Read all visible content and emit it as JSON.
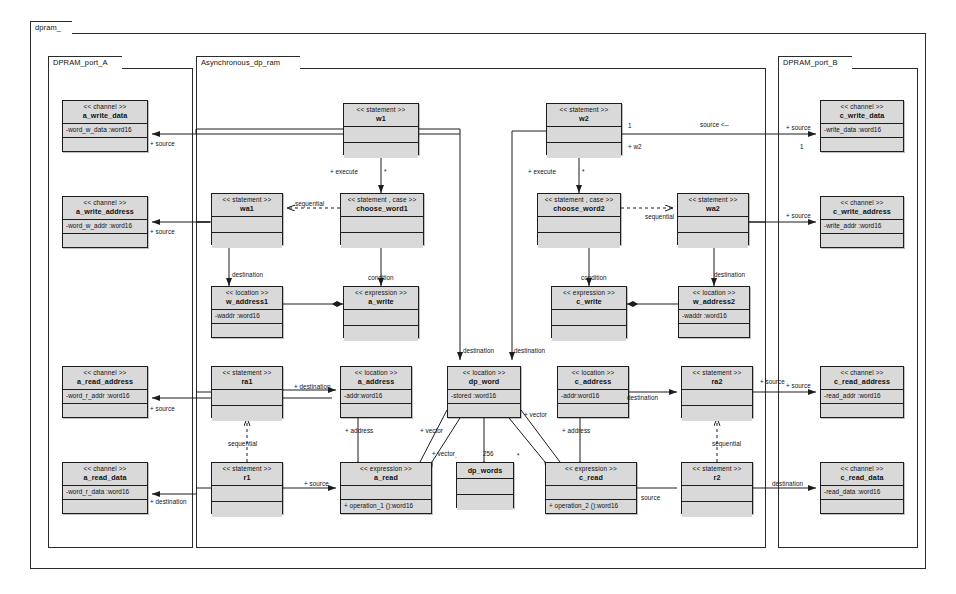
{
  "diagram": {
    "kind": "uml-class-diagram",
    "root_package": "dpram_"
  },
  "packages": [
    {
      "id": "pkg-dpram",
      "label": "dpram_",
      "x": 30,
      "y": 33,
      "w": 896,
      "h": 536,
      "tab_w": 42
    },
    {
      "id": "pkg-port-a",
      "label": "DPRAM_port_A",
      "x": 48,
      "y": 68,
      "w": 145,
      "h": 480,
      "tab_w": 74
    },
    {
      "id": "pkg-async",
      "label": "Asynchronous_dp_ram",
      "x": 196,
      "y": 68,
      "w": 570,
      "h": 480,
      "tab_w": 104
    },
    {
      "id": "pkg-port-b",
      "label": "DPRAM_port_B",
      "x": 778,
      "y": 68,
      "w": 140,
      "h": 480,
      "tab_w": 74
    }
  ],
  "classes": [
    {
      "id": "a_write_data",
      "stereotype": "<< channel >>",
      "name": "a_write_data",
      "attrs": [
        "-word_w_data :word16"
      ],
      "ops": [],
      "x": 62,
      "y": 100,
      "w": 86,
      "h": 52
    },
    {
      "id": "a_write_address",
      "stereotype": "<< channel >>",
      "name": "a_write_address",
      "attrs": [
        "-word_w_addr :word16"
      ],
      "ops": [],
      "x": 62,
      "y": 196,
      "w": 86,
      "h": 52
    },
    {
      "id": "a_read_address",
      "stereotype": "<< channel >>",
      "name": "a_read_address",
      "attrs": [
        "-word_r_addr :word16"
      ],
      "ops": [],
      "x": 62,
      "y": 366,
      "w": 86,
      "h": 52
    },
    {
      "id": "a_read_data",
      "stereotype": "<< channel >>",
      "name": "a_read_data",
      "attrs": [
        "-word_r_data :word16"
      ],
      "ops": [],
      "x": 62,
      "y": 462,
      "w": 86,
      "h": 52
    },
    {
      "id": "c_write_data",
      "stereotype": "<< channel >>",
      "name": "c_write_data",
      "attrs": [
        "-write_data :word16"
      ],
      "ops": [],
      "x": 820,
      "y": 100,
      "w": 84,
      "h": 52
    },
    {
      "id": "c_write_address",
      "stereotype": "<< channel >>",
      "name": "c_write_address",
      "attrs": [
        "-write_addr :word16"
      ],
      "ops": [],
      "x": 820,
      "y": 196,
      "w": 84,
      "h": 52
    },
    {
      "id": "c_read_address",
      "stereotype": "<< channel >>",
      "name": "c_read_address",
      "attrs": [
        "-read_addr :word16"
      ],
      "ops": [],
      "x": 820,
      "y": 366,
      "w": 84,
      "h": 52
    },
    {
      "id": "c_read_data",
      "stereotype": "<< channel >>",
      "name": "c_read_data",
      "attrs": [
        "-read_data :word16"
      ],
      "ops": [],
      "x": 820,
      "y": 462,
      "w": 84,
      "h": 52
    },
    {
      "id": "w1",
      "stereotype": "<< statement >>",
      "name": "w1",
      "attrs": [],
      "ops": [],
      "x": 343,
      "y": 103,
      "w": 76,
      "h": 52
    },
    {
      "id": "w2",
      "stereotype": "<< statement >>",
      "name": "w2",
      "attrs": [],
      "ops": [],
      "x": 546,
      "y": 103,
      "w": 76,
      "h": 52
    },
    {
      "id": "wa1",
      "stereotype": "<< statement >>",
      "name": "wa1",
      "attrs": [],
      "ops": [],
      "x": 211,
      "y": 193,
      "w": 72,
      "h": 52
    },
    {
      "id": "choose_word1",
      "stereotype": "<< statement , case >>",
      "name": "choose_word1",
      "attrs": [],
      "ops": [],
      "x": 340,
      "y": 193,
      "w": 84,
      "h": 52
    },
    {
      "id": "choose_word2",
      "stereotype": "<< statement , case >>",
      "name": "choose_word2",
      "attrs": [],
      "ops": [],
      "x": 537,
      "y": 193,
      "w": 84,
      "h": 52
    },
    {
      "id": "wa2",
      "stereotype": "<< statement >>",
      "name": "wa2",
      "attrs": [],
      "ops": [],
      "x": 677,
      "y": 193,
      "w": 72,
      "h": 52
    },
    {
      "id": "w_address1",
      "stereotype": "<< location >>",
      "name": "w_address1",
      "attrs": [
        "-waddr :word16"
      ],
      "ops": [],
      "x": 211,
      "y": 286,
      "w": 72,
      "h": 52
    },
    {
      "id": "a_write_expr",
      "stereotype": "<< expression >>",
      "name": "a_write",
      "attrs": [],
      "ops": [],
      "x": 343,
      "y": 286,
      "w": 76,
      "h": 52
    },
    {
      "id": "c_write_expr",
      "stereotype": "<< expression >>",
      "name": "c_write",
      "attrs": [],
      "ops": [],
      "x": 551,
      "y": 286,
      "w": 76,
      "h": 52
    },
    {
      "id": "w_address2",
      "stereotype": "<< location >>",
      "name": "w_address2",
      "attrs": [
        "-waddr :word16"
      ],
      "ops": [],
      "x": 678,
      "y": 286,
      "w": 72,
      "h": 52
    },
    {
      "id": "ra1",
      "stereotype": "<< statement >>",
      "name": "ra1",
      "attrs": [],
      "ops": [],
      "x": 211,
      "y": 366,
      "w": 72,
      "h": 52
    },
    {
      "id": "a_address",
      "stereotype": "<< location >>",
      "name": "a_address",
      "attrs": [
        "-addr:word16"
      ],
      "ops": [],
      "x": 340,
      "y": 366,
      "w": 72,
      "h": 52
    },
    {
      "id": "dp_word",
      "stereotype": "<< location >>",
      "name": "dp_word",
      "attrs": [
        "-stored :word16"
      ],
      "ops": [],
      "x": 447,
      "y": 366,
      "w": 74,
      "h": 52
    },
    {
      "id": "c_address",
      "stereotype": "<< location >>",
      "name": "c_address",
      "attrs": [
        "-addr:word16"
      ],
      "ops": [],
      "x": 557,
      "y": 366,
      "w": 72,
      "h": 52
    },
    {
      "id": "ra2",
      "stereotype": "<< statement >>",
      "name": "ra2",
      "attrs": [],
      "ops": [],
      "x": 681,
      "y": 366,
      "w": 72,
      "h": 52
    },
    {
      "id": "r1",
      "stereotype": "<< statement >>",
      "name": "r1",
      "attrs": [],
      "ops": [],
      "x": 211,
      "y": 462,
      "w": 72,
      "h": 52
    },
    {
      "id": "a_read_expr",
      "stereotype": "<< expression >>",
      "name": "a_read",
      "attrs": [],
      "ops": [
        "+ operation_1 ():word16"
      ],
      "x": 340,
      "y": 462,
      "w": 92,
      "h": 52
    },
    {
      "id": "dp_words",
      "stereotype": "",
      "name": "dp_words",
      "attrs": [],
      "ops": [],
      "x": 456,
      "y": 462,
      "w": 58,
      "h": 46
    },
    {
      "id": "c_read_expr",
      "stereotype": "<< expression >>",
      "name": "c_read",
      "attrs": [],
      "ops": [
        "+ operation_2 ():word16"
      ],
      "x": 545,
      "y": 462,
      "w": 92,
      "h": 52
    },
    {
      "id": "r2",
      "stereotype": "<< statement >>",
      "name": "r2",
      "attrs": [],
      "ops": [],
      "x": 681,
      "y": 462,
      "w": 72,
      "h": 52
    }
  ],
  "edge_labels": [
    {
      "id": "l-src-awd",
      "text": "+ source",
      "x": 150,
      "y": 140
    },
    {
      "id": "l-src-awa",
      "text": "+ source",
      "x": 150,
      "y": 228
    },
    {
      "id": "l-src-ara",
      "text": "+ source",
      "x": 150,
      "y": 405
    },
    {
      "id": "l-dst-ard",
      "text": "+ destination",
      "x": 150,
      "y": 498
    },
    {
      "id": "l-src-cwd",
      "text": "+ source",
      "x": 786,
      "y": 124
    },
    {
      "id": "l-one-cwd",
      "text": "1",
      "x": 800,
      "y": 143
    },
    {
      "id": "l-src-cwa",
      "text": "+ source",
      "x": 786,
      "y": 212
    },
    {
      "id": "l-src-cra",
      "text": "+ source",
      "x": 786,
      "y": 382
    },
    {
      "id": "l-dst-crd",
      "text": "destination",
      "x": 772,
      "y": 480
    },
    {
      "id": "l-exec-1",
      "text": "+ execute",
      "x": 330,
      "y": 168
    },
    {
      "id": "l-star-1",
      "text": "*",
      "x": 384,
      "y": 168
    },
    {
      "id": "l-exec-2",
      "text": "+ execute",
      "x": 528,
      "y": 168
    },
    {
      "id": "l-star-2",
      "text": "*",
      "x": 582,
      "y": 168
    },
    {
      "id": "l-one-w2",
      "text": "1",
      "x": 628,
      "y": 122
    },
    {
      "id": "l-plus-w2",
      "text": "+ w2",
      "x": 628,
      "y": 143
    },
    {
      "id": "l-source-arrow",
      "text": "source <--",
      "x": 700,
      "y": 121
    },
    {
      "id": "l-seq-1",
      "text": "sequential",
      "x": 295,
      "y": 200
    },
    {
      "id": "l-seq-2",
      "text": "sequential",
      "x": 645,
      "y": 213
    },
    {
      "id": "l-dest-wa1",
      "text": "destination",
      "x": 232,
      "y": 271
    },
    {
      "id": "l-dest-wa2",
      "text": "destination",
      "x": 714,
      "y": 271
    },
    {
      "id": "l-cond-1",
      "text": "condition",
      "x": 368,
      "y": 274
    },
    {
      "id": "l-cond-2",
      "text": "condition",
      "x": 581,
      "y": 274
    },
    {
      "id": "l-dest-dpw-l",
      "text": "destination",
      "x": 463,
      "y": 347
    },
    {
      "id": "l-dest-dpw-r",
      "text": "destination",
      "x": 514,
      "y": 347
    },
    {
      "id": "l-dest-ra1",
      "text": "+ destination",
      "x": 294,
      "y": 383
    },
    {
      "id": "l-dest-ra2",
      "text": "destination",
      "x": 627,
      "y": 394
    },
    {
      "id": "l-addr-a",
      "text": "+ address",
      "x": 345,
      "y": 427
    },
    {
      "id": "l-addr-c",
      "text": "+ address",
      "x": 562,
      "y": 427
    },
    {
      "id": "l-vector-l",
      "text": "+ vector",
      "x": 420,
      "y": 427
    },
    {
      "id": "l-vector-r",
      "text": "+ vector",
      "x": 524,
      "y": 411
    },
    {
      "id": "l-vec-bl",
      "text": "+ vector",
      "x": 432,
      "y": 450
    },
    {
      "id": "l-256",
      "text": "256",
      "x": 483,
      "y": 450
    },
    {
      "id": "l-dot-l",
      "text": ".",
      "x": 455,
      "y": 452
    },
    {
      "id": "l-dot-r",
      "text": "*",
      "x": 517,
      "y": 452
    },
    {
      "id": "l-seq-r1",
      "text": "sequential",
      "x": 228,
      "y": 440
    },
    {
      "id": "l-seq-r2",
      "text": "sequential",
      "x": 712,
      "y": 440
    },
    {
      "id": "l-src-r1",
      "text": "+ source",
      "x": 304,
      "y": 480
    },
    {
      "id": "l-src-r2",
      "text": "source",
      "x": 641,
      "y": 494
    },
    {
      "id": "l-src-ra2",
      "text": "+ source",
      "x": 760,
      "y": 378
    }
  ]
}
